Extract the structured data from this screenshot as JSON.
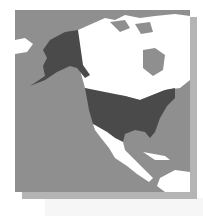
{
  "map": {
    "title": "United States locator map",
    "highlighted_region": "United States",
    "colors": {
      "ocean": "#8f8f8f",
      "land": "#ffffff",
      "highlight": "#4a4a4a",
      "shadow": "#b4b4b4"
    }
  }
}
